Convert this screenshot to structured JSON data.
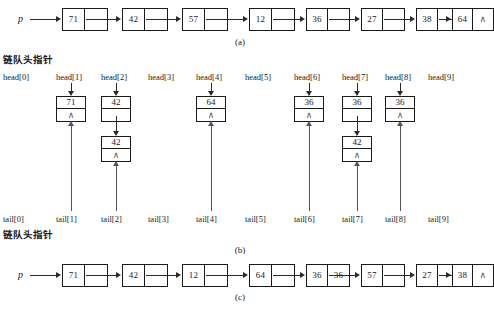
{
  "figure": {
    "title_labels": {
      "head_pointer_cn": "链队头指针",
      "tail_pointer_cn": "链队头指针"
    },
    "captions": {
      "a": "(a)",
      "b": "(b)",
      "c": "(c)"
    },
    "pointer_name": "p",
    "nil_symbol": "∧"
  },
  "panel_a": {
    "caption": "(a)",
    "pointer_label": "p",
    "nodes": [
      {
        "value": "71",
        "next": "link"
      },
      {
        "value": "42",
        "next": "link"
      },
      {
        "value": "57",
        "next": "link"
      },
      {
        "value": "12",
        "next": "link"
      },
      {
        "value": "36",
        "next": "link"
      },
      {
        "value": "27",
        "next": "link"
      },
      {
        "value": "38",
        "next": "link"
      },
      {
        "value": "64",
        "next": "nil"
      }
    ]
  },
  "panel_b": {
    "caption": "(b)",
    "head_label_cn": "链队头指针",
    "tail_label_cn": "链队头指针",
    "head_labels": [
      "head[0]",
      "head[1]",
      "head[2]",
      "head[3]",
      "head[4]",
      "head[5]",
      "head[6]",
      "head[7]",
      "head[8]",
      "head[9]"
    ],
    "tail_labels": [
      "tail[0]",
      "tail[1]",
      "tail[2]",
      "tail[3]",
      "tail[4]",
      "tail[5]",
      "tail[6]",
      "tail[7]",
      "tail[8]",
      "tail[9]"
    ],
    "buckets": [
      {
        "index": 0,
        "nodes": []
      },
      {
        "index": 1,
        "nodes": [
          {
            "value": "71",
            "next": "nil"
          }
        ]
      },
      {
        "index": 2,
        "nodes": [
          {
            "value": "42",
            "next": "link"
          },
          {
            "value": "42",
            "next": "nil"
          }
        ]
      },
      {
        "index": 3,
        "nodes": []
      },
      {
        "index": 4,
        "nodes": [
          {
            "value": "64",
            "next": "nil"
          }
        ]
      },
      {
        "index": 5,
        "nodes": []
      },
      {
        "index": 6,
        "nodes": [
          {
            "value": "36",
            "next": "nil"
          }
        ]
      },
      {
        "index": 7,
        "nodes": [
          {
            "value": "36",
            "next": "link"
          },
          {
            "value": "42",
            "next": "nil"
          }
        ]
      },
      {
        "index": 8,
        "nodes": [
          {
            "value": "36",
            "next": "nil"
          }
        ]
      },
      {
        "index": 9,
        "nodes": []
      }
    ]
  },
  "panel_c": {
    "caption": "(c)",
    "pointer_label": "p",
    "nodes": [
      {
        "value": "71",
        "next": "link"
      },
      {
        "value": "42",
        "next": "link"
      },
      {
        "value": "12",
        "next": "link"
      },
      {
        "value": "64",
        "next": "link"
      },
      {
        "value": "36",
        "next": "36"
      },
      {
        "value": "57",
        "next": "link"
      },
      {
        "value": "27",
        "next": "link"
      },
      {
        "value": "38",
        "next": "nil"
      }
    ]
  }
}
